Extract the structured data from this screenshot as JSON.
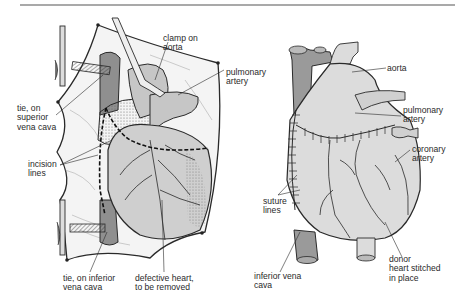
{
  "figure": {
    "left_panel": {
      "title": "Recipient heart before removal",
      "labels": {
        "clamp": "clamp on\naorta",
        "pulmonary": "pulmonary\nartery",
        "tie_superior": "tie, on\nsuperior\nvena cava",
        "incision": "incision\nlines",
        "tie_inferior": "tie, on inferior\nvena cava",
        "defective": "defective heart,\nto be removed"
      }
    },
    "right_panel": {
      "title": "Donor heart in place",
      "labels": {
        "aorta": "aorta",
        "pulmonary": "pulmonary\nartery",
        "coronary": "coronary\nartery",
        "suture": "suture\nlines",
        "inferior_vena_cava": "inferior vena\ncava",
        "donor": "donor\nheart stitched\nin place"
      }
    },
    "colors": {
      "line": "#2a2a2a",
      "heart_fill": "#dcdcdc",
      "vessel_dark": "#9a9a9a",
      "drape": "#f4f4f4",
      "rule": "#a9a9a9"
    }
  }
}
